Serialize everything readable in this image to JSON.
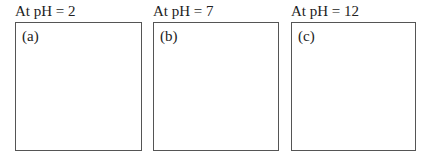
{
  "panels": [
    {
      "title": "At pH = 2",
      "label": "(a)"
    },
    {
      "title": "At pH = 7",
      "label": "(b)"
    },
    {
      "title": "At pH = 12",
      "label": "(c)"
    }
  ]
}
